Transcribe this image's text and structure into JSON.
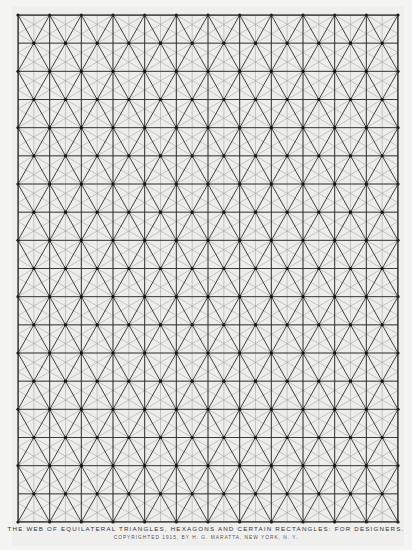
{
  "document": {
    "type": "design grid plate",
    "caption_line1": "THE WEB OF EQUILATERAL TRIANGLES, HEXAGONS AND CERTAIN RECTANGLES: FOR DESIGNERS.",
    "caption_line2": "COPYRIGHTED 1915, BY H. G. MARATTA, NEW YORK, N. Y."
  },
  "grid": {
    "left": 18,
    "top": 15,
    "right": 398,
    "bottom": 522,
    "columns": 12,
    "rows": 18,
    "major_color": "#2a2a2a",
    "minor_color": "#9a9a9a",
    "node_color": "#111111",
    "background": "#ededec"
  }
}
